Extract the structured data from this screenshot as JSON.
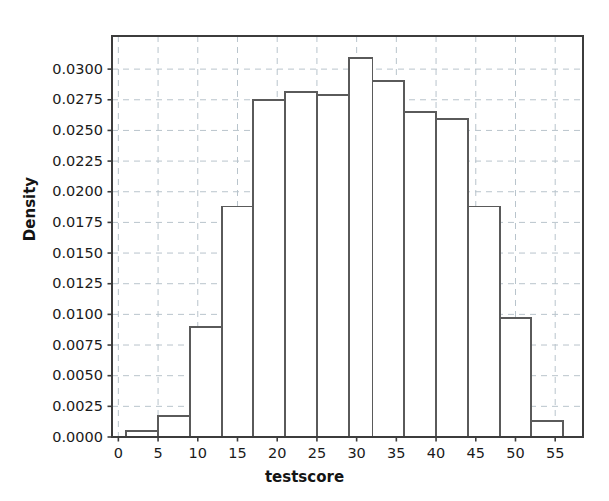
{
  "chart_data": {
    "type": "bar",
    "subtype": "histogram",
    "title": "",
    "xlabel": "testscore",
    "ylabel": "Density",
    "xlim": [
      -0.8,
      58.5
    ],
    "ylim": [
      0.0,
      0.0327
    ],
    "grid": true,
    "grid_style": "dashed",
    "legend": null,
    "bin_edges": [
      1,
      5,
      9,
      13,
      17,
      21,
      25,
      29,
      32,
      36,
      40,
      44,
      48,
      52,
      56
    ],
    "categories": [
      "1-5",
      "5-9",
      "9-13",
      "13-17",
      "17-21",
      "21-25",
      "25-29",
      "29-32",
      "32-36",
      "36-40",
      "40-44",
      "44-48",
      "48-52",
      "52-56"
    ],
    "values": [
      0.0005,
      0.0017,
      0.009,
      0.0188,
      0.0275,
      0.0281,
      0.0279,
      0.0309,
      0.029,
      0.0265,
      0.0259,
      0.0188,
      0.0097,
      0.0013
    ],
    "xticks": [
      0,
      5,
      10,
      15,
      20,
      25,
      30,
      35,
      40,
      45,
      50,
      55
    ],
    "xtick_labels": [
      "0",
      "5",
      "10",
      "15",
      "20",
      "25",
      "30",
      "35",
      "40",
      "45",
      "50",
      "55"
    ],
    "yticks": [
      0.0,
      0.0025,
      0.005,
      0.0075,
      0.01,
      0.0125,
      0.015,
      0.0175,
      0.02,
      0.0225,
      0.025,
      0.0275,
      0.03
    ],
    "ytick_labels": [
      "0.0000",
      "0.0025",
      "0.0050",
      "0.0075",
      "0.0100",
      "0.0125",
      "0.0150",
      "0.0175",
      "0.0200",
      "0.0225",
      "0.0250",
      "0.0275",
      "0.0300"
    ],
    "colors": {
      "bar_edge": "#5a5a5a",
      "bar_fill": "#ffffff",
      "axis": "#3c3c3c",
      "grid": "#b9c4cc",
      "text": "#1a1a1a",
      "background": "#ffffff"
    }
  }
}
